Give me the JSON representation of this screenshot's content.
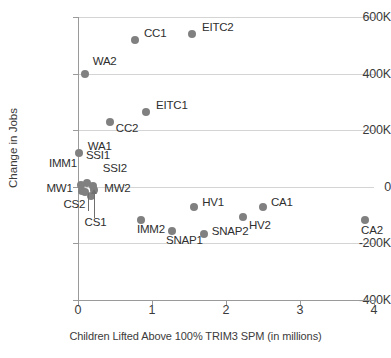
{
  "chart_data": {
    "type": "scatter",
    "title": "",
    "xlabel": "Children Lifted Above 100% TRIM3 SPM (in millions)",
    "ylabel": "Change in Jobs",
    "xlim": [
      0,
      4
    ],
    "ylim": [
      -400000,
      600000
    ],
    "xticks": [
      "0",
      "1",
      "2",
      "3",
      "4"
    ],
    "xtick_values": [
      0,
      1,
      2,
      3,
      4
    ],
    "yticks": [
      "600K",
      "400K",
      "200K",
      "0",
      "-200K",
      "-400K"
    ],
    "ytick_values": [
      600000,
      400000,
      200000,
      0,
      -200000,
      -400000
    ],
    "grid": true,
    "legend": "none",
    "points": [
      {
        "label": "EITC2",
        "x": 1.54,
        "y": 540000,
        "lx": 10,
        "ly": -7
      },
      {
        "label": "CC1",
        "x": 0.77,
        "y": 520000,
        "lx": 9,
        "ly": -7
      },
      {
        "label": "WA2",
        "x": 0.09,
        "y": 398000,
        "lx": 8,
        "ly": -13
      },
      {
        "label": "EITC1",
        "x": 0.92,
        "y": 265000,
        "lx": 10,
        "ly": -7
      },
      {
        "label": "CC2",
        "x": 0.43,
        "y": 230000,
        "lx": 6,
        "ly": 6
      },
      {
        "label": "WA1",
        "x": 0.01,
        "y": 120000,
        "lx": 9,
        "ly": -7
      },
      {
        "label": "IMM1",
        "x": 0.04,
        "y": 5000,
        "lx": -32,
        "ly": -22
      },
      {
        "label": "SSI1",
        "x": 0.12,
        "y": 12000,
        "lx": -1,
        "ly": -28
      },
      {
        "label": "SSI2",
        "x": 0.2,
        "y": 2000,
        "lx": 10,
        "ly": -18
      },
      {
        "label": "MW2",
        "x": 0.22,
        "y": -12000,
        "lx": 10,
        "ly": -2
      },
      {
        "label": "MW1",
        "x": 0.06,
        "y": -14000,
        "lx": -36,
        "ly": -3
      },
      {
        "label": "CS2",
        "x": 0.1,
        "y": -20000,
        "lx": -22,
        "ly": 12
      },
      {
        "label": "CS1",
        "x": 0.17,
        "y": -32000,
        "lx": -6,
        "ly": 26
      },
      {
        "label": "IMM2",
        "x": 0.85,
        "y": -118000,
        "lx": -4,
        "ly": 9
      },
      {
        "label": "SNAP1",
        "x": 1.27,
        "y": -155000,
        "lx": -6,
        "ly": 9
      },
      {
        "label": "HV1",
        "x": 1.57,
        "y": -73000,
        "lx": 8,
        "ly": -5
      },
      {
        "label": "SNAP2",
        "x": 1.7,
        "y": -168000,
        "lx": 8,
        "ly": -3
      },
      {
        "label": "HV2",
        "x": 2.23,
        "y": -105000,
        "lx": 6,
        "ly": 8
      },
      {
        "label": "CA1",
        "x": 2.5,
        "y": -73000,
        "lx": 8,
        "ly": -5
      },
      {
        "label": "CA2",
        "x": 3.88,
        "y": -118000,
        "lx": -4,
        "ly": 10
      }
    ],
    "colors": {
      "point": "#808080",
      "grid": "#d4d4d4",
      "axis": "#9a9a9a",
      "text": "#3b3b3b"
    }
  }
}
